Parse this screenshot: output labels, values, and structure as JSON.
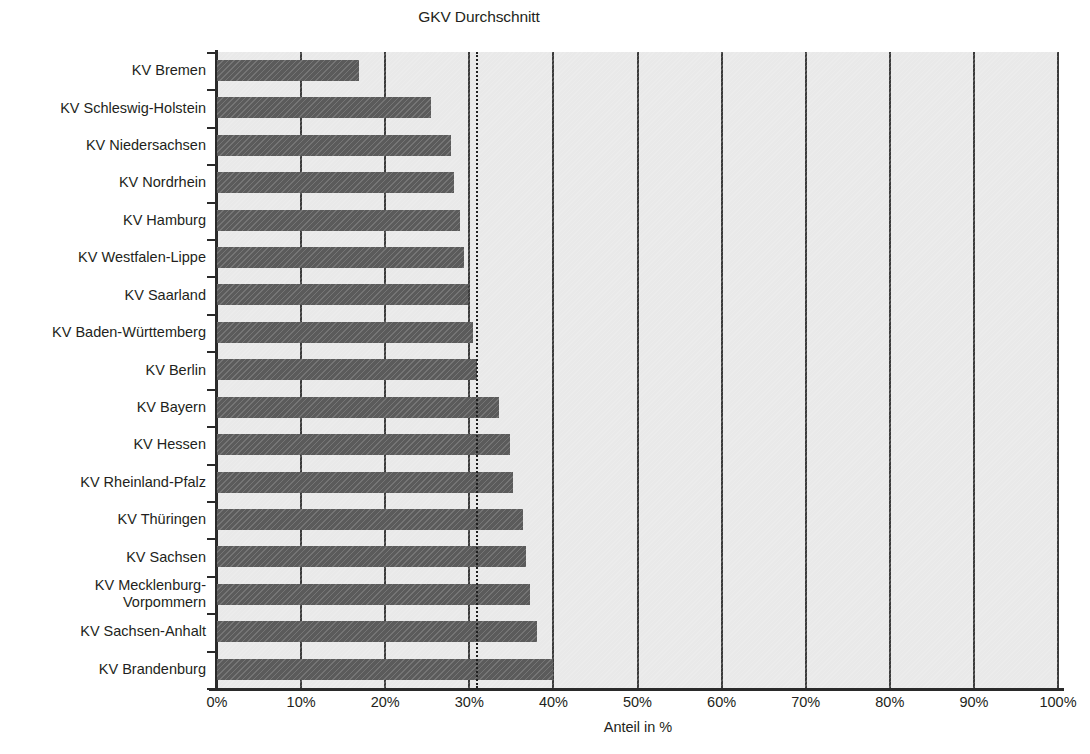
{
  "chart_data": {
    "type": "bar",
    "orientation": "horizontal",
    "title": "GKV Durchschnitt",
    "xlabel": "Anteil in %",
    "ylabel": "",
    "xlim": [
      0,
      100
    ],
    "xticks": [
      0,
      10,
      20,
      30,
      40,
      50,
      60,
      70,
      80,
      90,
      100
    ],
    "xtick_labels": [
      "0%",
      "10%",
      "20%",
      "30%",
      "40%",
      "50%",
      "60%",
      "70%",
      "80%",
      "90%",
      "100%"
    ],
    "grid": true,
    "legend": "none",
    "annotations": [
      {
        "label": "GKV Durchschnitt",
        "type": "vertical-dotted-reference-line",
        "value": 30.8
      }
    ],
    "categories": [
      "KV Bremen",
      "KV Schleswig-Holstein",
      "KV Niedersachsen",
      "KV Nordrhein",
      "KV Hamburg",
      "KV Westfalen-Lippe",
      "KV Saarland",
      "KV Baden-Württemberg",
      "KV Berlin",
      "KV Bayern",
      "KV Hessen",
      "KV Rheinland-Pfalz",
      "KV Thüringen",
      "KV Sachsen",
      "KV Mecklenburg-Vorpommern",
      "KV Sachsen-Anhalt",
      "KV Brandenburg"
    ],
    "values": [
      16.9,
      25.4,
      27.8,
      28.2,
      28.9,
      29.4,
      29.9,
      30.4,
      30.9,
      33.5,
      34.8,
      35.2,
      36.4,
      36.8,
      37.2,
      38.0,
      39.9
    ],
    "bar_color": "#5b5b5b",
    "plot_background": "#e9e9e9",
    "axis_color": "#2a2a2a"
  },
  "category_label_lines": [
    [
      "KV Bremen"
    ],
    [
      "KV Schleswig-Holstein"
    ],
    [
      "KV Niedersachsen"
    ],
    [
      "KV Nordrhein"
    ],
    [
      "KV Hamburg"
    ],
    [
      "KV Westfalen-Lippe"
    ],
    [
      "KV Saarland"
    ],
    [
      "KV Baden-Württemberg"
    ],
    [
      "KV Berlin"
    ],
    [
      "KV Bayern"
    ],
    [
      "KV Hessen"
    ],
    [
      "KV Rheinland-Pfalz"
    ],
    [
      "KV Thüringen"
    ],
    [
      "KV Sachsen"
    ],
    [
      "KV Mecklenburg-",
      "Vorpommern"
    ],
    [
      "KV Sachsen-Anhalt"
    ],
    [
      "KV Brandenburg"
    ]
  ]
}
